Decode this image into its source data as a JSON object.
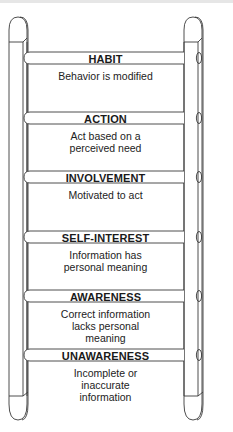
{
  "diagram": {
    "type": "ladder",
    "stages": [
      {
        "label": "HABIT",
        "description": "Behavior is modified",
        "rung_y": 52,
        "desc_lines": [
          "Behavior is modified"
        ]
      },
      {
        "label": "ACTION",
        "description": "Act based on a perceived need",
        "rung_y": 112,
        "desc_lines": [
          "Act based on a",
          "perceived need"
        ]
      },
      {
        "label": "INVOLVEMENT",
        "description": "Motivated to act",
        "rung_y": 171,
        "desc_lines": [
          "Motivated to act"
        ]
      },
      {
        "label": "SELF-INTEREST",
        "description": "Information has personal meaning",
        "rung_y": 231,
        "desc_lines": [
          "Information has",
          "personal meaning"
        ]
      },
      {
        "label": "AWARENESS",
        "description": "Correct information lacks personal meaning",
        "rung_y": 290,
        "desc_lines": [
          "Correct information",
          "lacks personal",
          "meaning"
        ]
      },
      {
        "label": "UNAWARENESS",
        "description": "Incomplete or inaccurate information",
        "rung_y": 349,
        "desc_lines": [
          "Incomplete or",
          "inaccurate",
          "information"
        ]
      }
    ],
    "colors": {
      "stroke": "#3a3a3a",
      "background": "#ffffff"
    }
  }
}
